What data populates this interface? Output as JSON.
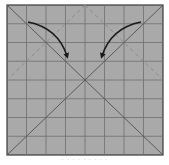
{
  "diagram": {
    "type": "origami-fold-step",
    "paper": {
      "fill": "#a9a9a9",
      "border_color": "#3a3a3a",
      "grid_divisions": 8,
      "grid_color": "#6e6e6e"
    },
    "crease_lines": [
      {
        "name": "diagonal-top-left-to-bottom-right",
        "style": "solid"
      },
      {
        "name": "diagonal-top-right-to-bottom-left",
        "style": "solid"
      }
    ],
    "fold_lines": [
      {
        "name": "valley-fold-left",
        "style": "dashed",
        "from": "top-center",
        "to": "left-edge-middle"
      },
      {
        "name": "valley-fold-right",
        "style": "dashed",
        "from": "top-center",
        "to": "right-edge-middle"
      }
    ],
    "arrows": [
      {
        "name": "fold-arrow-left",
        "direction": "from top-left toward center",
        "color": "#1a1a1a"
      },
      {
        "name": "fold-arrow-right",
        "direction": "from top-right toward center",
        "color": "#1a1a1a"
      }
    ],
    "caption": "· · ·   · · · · · ·"
  }
}
